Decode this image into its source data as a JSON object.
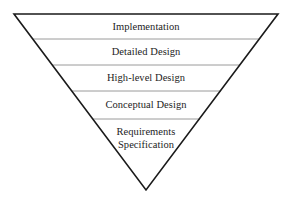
{
  "diagram": {
    "type": "inverted-triangle",
    "canvas": {
      "width": 290,
      "height": 205
    },
    "colors": {
      "outline": "#1a1a1a",
      "divider": "#9a9a9a",
      "text": "#1d1d1d",
      "background": "#ffffff"
    },
    "geometry": {
      "top_left": {
        "x": 14,
        "y": 14
      },
      "top_right": {
        "x": 278,
        "y": 14
      },
      "apex": {
        "x": 146,
        "y": 190
      },
      "outline_width": 1.6,
      "divider_width": 1.0
    },
    "dividers": [
      {
        "y": 39,
        "x1": 33,
        "x2": 259
      },
      {
        "y": 65,
        "x1": 52,
        "x2": 240
      },
      {
        "y": 91,
        "x1": 72,
        "x2": 221
      },
      {
        "y": 119,
        "x1": 93,
        "x2": 200
      }
    ],
    "layers": [
      {
        "id": "implementation",
        "label": "Implementation",
        "center": {
          "x": 146,
          "y": 27
        },
        "order": 1
      },
      {
        "id": "detailed-design",
        "label": "Detailed Design",
        "center": {
          "x": 146,
          "y": 52
        },
        "order": 2
      },
      {
        "id": "high-level-design",
        "label": "High-level Design",
        "center": {
          "x": 146,
          "y": 78
        },
        "order": 3
      },
      {
        "id": "conceptual-design",
        "label": "Conceptual Design",
        "center": {
          "x": 146,
          "y": 105
        },
        "order": 4
      },
      {
        "id": "requirements-specification",
        "label": "Requirements\nSpecification",
        "center": {
          "x": 146,
          "y": 138
        },
        "order": 5
      }
    ]
  }
}
